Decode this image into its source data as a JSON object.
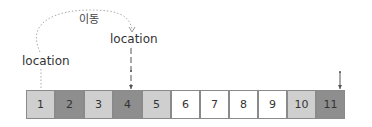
{
  "diagram": {
    "move_label": "이동",
    "location_label_1": "location",
    "location_label_2": "location",
    "cells": [
      {
        "label": "1",
        "color": "#cfcfcf"
      },
      {
        "label": "2",
        "color": "#8e8e8e"
      },
      {
        "label": "3",
        "color": "#cfcfcf"
      },
      {
        "label": "4",
        "color": "#8e8e8e"
      },
      {
        "label": "5",
        "color": "#cfcfcf"
      },
      {
        "label": "6",
        "color": "#ffffff"
      },
      {
        "label": "7",
        "color": "#ffffff"
      },
      {
        "label": "8",
        "color": "#ffffff"
      },
      {
        "label": "9",
        "color": "#ffffff"
      },
      {
        "label": "10",
        "color": "#cfcfcf"
      },
      {
        "label": "11",
        "color": "#8e8e8e"
      }
    ]
  }
}
